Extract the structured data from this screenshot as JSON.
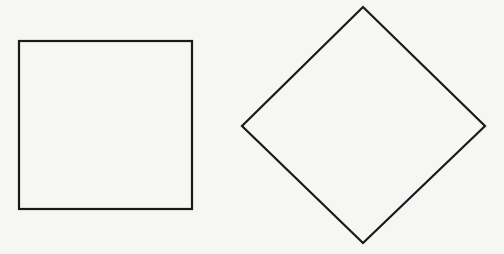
{
  "background": "#f6f6f4",
  "stroke_color": "#1a1a1a",
  "stroke_width": 2.2,
  "shapes": [
    {
      "name": "square",
      "type": "rect",
      "x": 19,
      "y": 41,
      "width": 173,
      "height": 168
    },
    {
      "name": "diamond",
      "type": "polygon",
      "points": [
        [
          363,
          7
        ],
        [
          485,
          126
        ],
        [
          363,
          243
        ],
        [
          242,
          126
        ]
      ]
    }
  ]
}
